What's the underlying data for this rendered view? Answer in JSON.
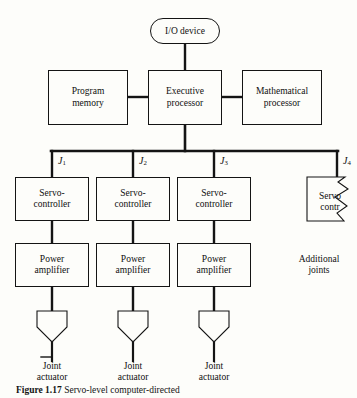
{
  "figure": {
    "domain_type": "block-diagram",
    "background_color": "#fdfdfa",
    "line_color": "#141414",
    "text_color": "#101010",
    "caption_number": "Figure 1.17",
    "caption_text": "Servo-level computer-directed",
    "caption_clipped": true
  },
  "top_level": {
    "io_device": "I/O device",
    "program_memory_line1": "Program",
    "program_memory_line2": "memory",
    "executive_processor_line1": "Executive",
    "executive_processor_line2": "processor",
    "mathematical_processor_line1": "Mathematical",
    "mathematical_processor_line2": "processor"
  },
  "bus": {
    "joint_labels": [
      "J",
      "J",
      "J",
      "J"
    ],
    "joint_subscripts": [
      "1",
      "2",
      "3",
      "4"
    ]
  },
  "branches": [
    {
      "joint_label": "J",
      "joint_subscript": "1",
      "servo_line1": "Servo-",
      "servo_line2": "controller",
      "amp_line1": "Power",
      "amp_line2": "amplifier",
      "actuator_line1": "Joint",
      "actuator_line2": "actuator"
    },
    {
      "joint_label": "J",
      "joint_subscript": "2",
      "servo_line1": "Servo-",
      "servo_line2": "controller",
      "amp_line1": "Power",
      "amp_line2": "amplifier",
      "actuator_line1": "Joint",
      "actuator_line2": "actuator"
    },
    {
      "joint_label": "J",
      "joint_subscript": "3",
      "servo_line1": "Servo-",
      "servo_line2": "controller",
      "amp_line1": "Power",
      "amp_line2": "amplifier",
      "actuator_line1": "Joint",
      "actuator_line2": "actuator"
    },
    {
      "joint_label": "J",
      "joint_subscript": "4",
      "servo_line1": "Servo",
      "servo_line2": "contr",
      "truncated": true
    }
  ],
  "additional": {
    "line1": "Additional",
    "line2": "joints"
  }
}
